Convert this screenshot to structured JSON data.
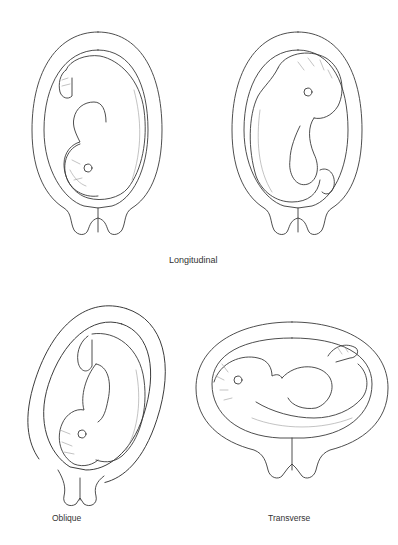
{
  "figure": {
    "caption_group_top": "Longitudinal",
    "panels": [
      {
        "id": "longitudinal-breech",
        "position": "top-left",
        "label": ""
      },
      {
        "id": "longitudinal-cephalic",
        "position": "top-right",
        "label": ""
      },
      {
        "id": "oblique",
        "position": "bottom-left",
        "label": "Oblique"
      },
      {
        "id": "transverse",
        "position": "bottom-right",
        "label": "Transverse"
      }
    ]
  },
  "colors": {
    "line": "#3a3a3a",
    "fine_line": "#9a9a9a",
    "background": "#ffffff",
    "text": "#333333"
  }
}
